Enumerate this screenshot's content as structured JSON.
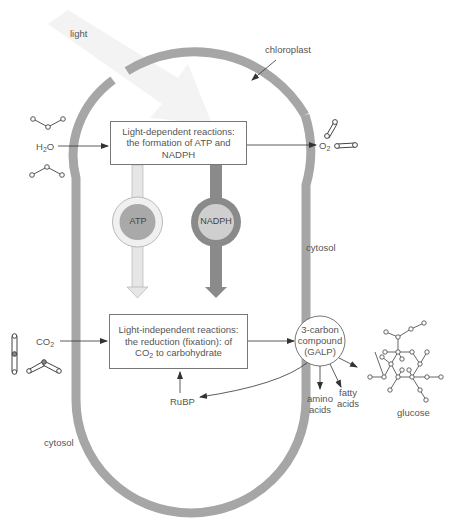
{
  "diagram": {
    "labels": {
      "light": "light",
      "chloroplast": "chloroplast",
      "cytosol_right": "cytosol",
      "cytosol_left": "cytosol",
      "h2o_main": "H",
      "h2o_sub": "2",
      "h2o_tail": "O",
      "o2_main": "O",
      "o2_sub": "2",
      "co2_main": "CO",
      "co2_sub": "2",
      "rubp": "RuBP",
      "amino_1": "amino",
      "amino_2": "acids",
      "fatty_1": "fatty",
      "fatty_2": "acids",
      "glucose": "glucose"
    },
    "light_dependent_box": {
      "line1": "Light-dependent reactions:",
      "line2": "the formation of ATP and NADPH"
    },
    "light_independent_box": {
      "line1": "Light-independent reactions:",
      "line2": "the reduction (fixation): of",
      "line3_main": "CO",
      "line3_sub": "2",
      "line3_tail": " to carbohydrate"
    },
    "carriers": {
      "atp": "ATP",
      "nadph": "NADPH"
    },
    "galp_circle": {
      "line1": "3-carbon",
      "line2": "compound",
      "line3": "(GALP)"
    },
    "colors": {
      "membrane": "#a6a6a6",
      "atp_arrow": "#e6e6e6",
      "atp_ring": "#f0f0f0",
      "atp_core": "#a9a9a9",
      "nadph_arrow": "#8a8a8a",
      "nadph_ring": "#8a8a8a",
      "nadph_core": "#cfcfcf",
      "light_arrow": "#f4f4f4",
      "line": "#444444"
    }
  }
}
